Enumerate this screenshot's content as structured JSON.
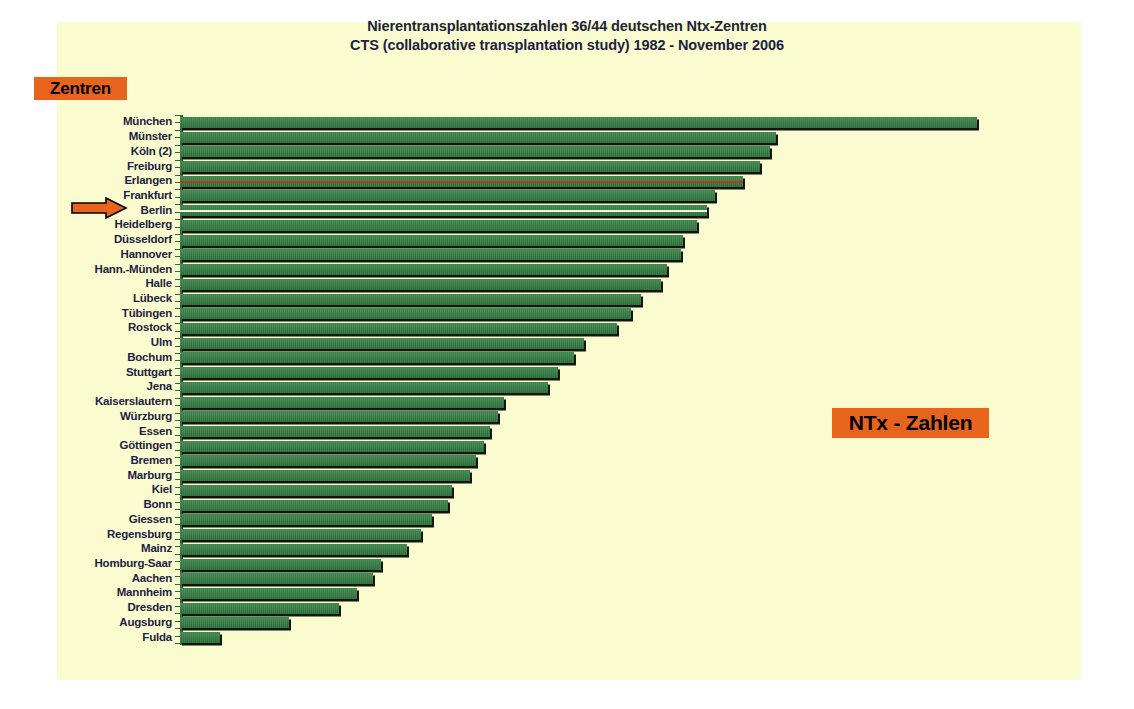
{
  "title": {
    "line1": "Nierentransplantationszahlen 36/44 deutschen Ntx-Zentren",
    "line2": "CTS (collaborative transplantation study) 1982 - November 2006"
  },
  "badges": {
    "left_label": "Zentren",
    "right_label": "NTx - Zahlen"
  },
  "colors": {
    "panel_background": "#fbfbd0",
    "page_background": "#ffffff",
    "bar_green": "#2f7a3e",
    "bar_shadow": "#12160f",
    "badge_orange": "#e8631b",
    "text_navy": "#1b2340",
    "highlight_red": "#b83a10",
    "highlight_white": "#f2f2e4",
    "arrow_orange": "#e8631b",
    "axis_green": "#2e6b35"
  },
  "marker": {
    "icon": "right-arrow-icon",
    "points_at": "Erlangen"
  },
  "chart_data": {
    "type": "bar",
    "orientation": "horizontal",
    "title": "Nierentransplantationszahlen 36/44 deutschen Ntx-Zentren",
    "subtitle": "CTS (collaborative transplantation study) 1982 - November 2006",
    "xlabel": "NTx - Zahlen",
    "ylabel": "Zentren",
    "grid": false,
    "legend": "none",
    "axis_tick_labels": [],
    "sorted": "descending",
    "highlighted": [
      "Erlangen",
      "Berlin"
    ],
    "categories": [
      "München",
      "Münster",
      "Köln (2)",
      "Freiburg",
      "Erlangen",
      "Frankfurt",
      "Berlin",
      "Heidelberg",
      "Düsseldorf",
      "Hannover",
      "Hann.-Münden",
      "Halle",
      "Lübeck",
      "Tübingen",
      "Rostock",
      "Ulm",
      "Bochum",
      "Stuttgart",
      "Jena",
      "Kaiserslautern",
      "Würzburg",
      "Essen",
      "Göttingen",
      "Bremen",
      "Marburg",
      "Kiel",
      "Bonn",
      "Giessen",
      "Regensburg",
      "Mainz",
      "Homburg-Saar",
      "Aachen",
      "Mannheim",
      "Dresden",
      "Augsburg",
      "Fulda"
    ],
    "values": [
      3960,
      2960,
      2930,
      2880,
      2800,
      2660,
      2620,
      2570,
      2500,
      2490,
      2420,
      2390,
      2290,
      2240,
      2170,
      2010,
      1960,
      1880,
      1830,
      1610,
      1580,
      1540,
      1510,
      1470,
      1440,
      1350,
      1330,
      1250,
      1200,
      1130,
      1000,
      960,
      880,
      790,
      540,
      200
    ],
    "xlim": [
      0,
      4100
    ],
    "units": "Transplantationen"
  }
}
